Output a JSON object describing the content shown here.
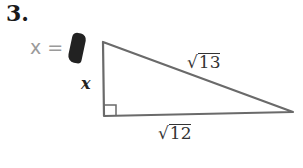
{
  "problem": {
    "number": "3.",
    "answer_prompt": "x =",
    "answer_value_obscured": true
  },
  "triangle": {
    "type": "right triangle",
    "vertices": {
      "top": [
        103,
        42
      ],
      "right_angle": [
        104,
        116
      ],
      "right": [
        293,
        112
      ]
    },
    "labels": {
      "vertical_leg": "x",
      "hypotenuse_radical": "√",
      "hypotenuse_value": "13",
      "base_radical": "√",
      "base_value": "12"
    },
    "stroke_color": "#6a6a6a"
  }
}
